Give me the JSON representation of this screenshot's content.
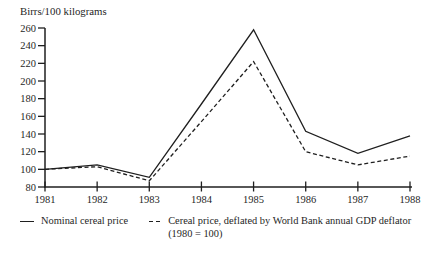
{
  "chart_data": {
    "type": "line",
    "title": "",
    "ylabel": "Birrs/100 kilograms",
    "xlabel": "",
    "x": [
      1981,
      1982,
      1983,
      1984,
      1985,
      1986,
      1987,
      1988
    ],
    "series": [
      {
        "name": "Nominal cereal price",
        "style": "solid",
        "values": [
          100,
          105,
          91,
          174,
          258,
          143,
          118,
          138
        ]
      },
      {
        "name": "Cereal price, deflated by World Bank annual GDP deflator (1980 = 100)",
        "style": "dashed",
        "values": [
          100,
          103,
          87,
          154,
          222,
          120,
          105,
          115
        ]
      }
    ],
    "ylim": [
      80,
      260
    ],
    "ytick_step": 20,
    "yticks": [
      80,
      100,
      120,
      140,
      160,
      180,
      200,
      220,
      240,
      260
    ],
    "xticks": [
      "1981",
      "1982",
      "1983",
      "1984",
      "1985",
      "1986",
      "1987",
      "1988"
    ],
    "grid": false,
    "legend_position": "bottom"
  },
  "legend": {
    "items": [
      {
        "swatch": "solid-line",
        "label": "Nominal cereal price"
      },
      {
        "swatch": "dashed-line",
        "label": "Cereal price, deflated by World Bank annual GDP deflator",
        "label_line2": "(1980 = 100)"
      }
    ]
  },
  "colors": {
    "line": "#1f1f1f",
    "text": "#1f1f1f",
    "background": "#ffffff"
  }
}
